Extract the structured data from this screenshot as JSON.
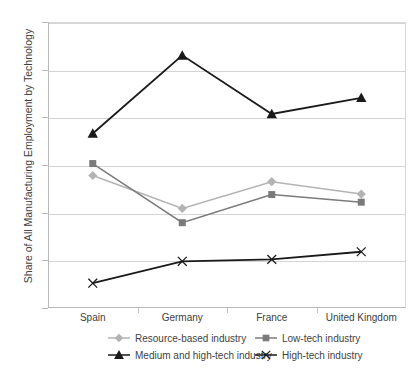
{
  "chart_data": {
    "type": "line",
    "title": "",
    "xlabel": "",
    "ylabel": "Share of All Manufacturing Employment by Technology",
    "categories": [
      "Spain",
      "Germany",
      "France",
      "United Kingdom"
    ],
    "ylim": [
      0,
      0.6
    ],
    "yticks": [
      "0",
      "0.1",
      "0.2",
      "0.3",
      "0.4",
      "0.5",
      "0.6"
    ],
    "ytick_values": [
      0,
      0.1,
      0.2,
      0.3,
      0.4,
      0.5,
      0.6
    ],
    "grid": true,
    "legend_position": "bottom",
    "series": [
      {
        "name": "Resource-based industry",
        "marker": "diamond",
        "color": "#b3b3b3",
        "values": [
          0.278,
          0.209,
          0.265,
          0.239
        ]
      },
      {
        "name": "Low-tech industry",
        "marker": "square",
        "color": "#7a7a7a",
        "values": [
          0.303,
          0.179,
          0.238,
          0.222
        ]
      },
      {
        "name": "Medium and high-tech industry",
        "marker": "triangle",
        "color": "#1a1a1a",
        "values": [
          0.366,
          0.53,
          0.407,
          0.441
        ]
      },
      {
        "name": "High-tech industry",
        "marker": "x",
        "color": "#1a1a1a",
        "values": [
          0.052,
          0.098,
          0.102,
          0.118
        ]
      }
    ]
  }
}
